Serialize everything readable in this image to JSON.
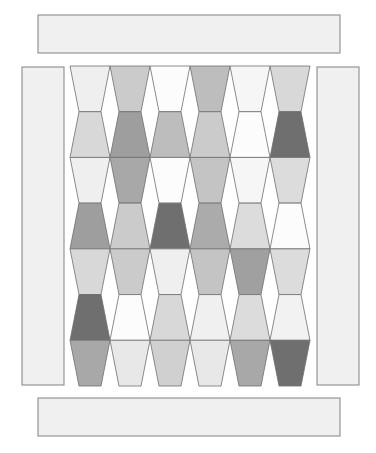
{
  "canvas": {
    "width": 376,
    "height": 453,
    "background": "#ffffff"
  },
  "outline_color": "#808080",
  "borders": {
    "fill": "#f0f0f0",
    "stroke": "#8c8c8c",
    "top": {
      "label": "top-border-strip",
      "x": 38,
      "y": 15,
      "width": 302,
      "height": 38
    },
    "bottom": {
      "label": "bottom-border-strip",
      "x": 38,
      "y": 398,
      "width": 302,
      "height": 38
    },
    "left": {
      "label": "left-border-strip",
      "x": 22,
      "y": 67,
      "width": 42,
      "height": 318
    },
    "right": {
      "label": "right-border-strip",
      "x": 317,
      "y": 67,
      "width": 42,
      "height": 318
    }
  },
  "center": {
    "label": "tumbler-center-block",
    "x": 70,
    "y": 66,
    "width": 240,
    "height": 320,
    "columns": 6,
    "rows": 7,
    "cell_width": 40,
    "row_height": 45.7,
    "taper": 9,
    "stroke": "#6e6e6e",
    "stroke_width": 0.8
  },
  "palette": {
    "white": "#fcfcfc",
    "near_white": "#f6f6f6",
    "very_light": "#efefef",
    "light": "#e4e4e4",
    "light_gray": "#d8d8d8",
    "medium_light": "#cbcbcb",
    "medium": "#bdbdbd",
    "medium_gray": "#b0b0b0",
    "medium_dark": "#9e9e9e",
    "dark_gray": "#8a8a8a",
    "darker": "#6f6f6f",
    "very_dark": "#555555"
  },
  "chart_data": {
    "type": "heatmap",
    "xlabel": "",
    "ylabel": "",
    "columns": 6,
    "rows": 7,
    "legend": [],
    "grid": false,
    "note": "Each cell is a tumbler (trapezoid) patch. Odd rows taper downward, even rows taper upward.",
    "values": [
      [
        "#efefef",
        "#cbcbcb",
        "#fcfcfc",
        "#bdbdbd",
        "#f6f6f6",
        "#d8d8d8"
      ],
      [
        "#d8d8d8",
        "#9e9e9e",
        "#bdbdbd",
        "#cbcbcb",
        "#fcfcfc",
        "#6f6f6f"
      ],
      [
        "#efefef",
        "#a8a8a8",
        "#fcfcfc",
        "#c4c4c4",
        "#f6f6f6",
        "#dcdcdc"
      ],
      [
        "#9e9e9e",
        "#cbcbcb",
        "#6f6f6f",
        "#ababab",
        "#dcdcdc",
        "#fcfcfc"
      ],
      [
        "#d8d8d8",
        "#cbcbcb",
        "#efefef",
        "#c4c4c4",
        "#a0a0a0",
        "#dcdcdc"
      ],
      [
        "#6f6f6f",
        "#fcfcfc",
        "#d8d8d8",
        "#f0f0f0",
        "#dcdcdc",
        "#f2f2f2"
      ],
      [
        "#a8a8a8",
        "#e8e8e8",
        "#d0d0d0",
        "#e8e8e8",
        "#a8a8a8",
        "#6f6f6f"
      ]
    ],
    "row_labels": [
      "row-1",
      "row-2",
      "row-3",
      "row-4",
      "row-5",
      "row-6",
      "row-7"
    ],
    "column_labels": [
      "col-1",
      "col-2",
      "col-3",
      "col-4",
      "col-5",
      "col-6"
    ]
  }
}
